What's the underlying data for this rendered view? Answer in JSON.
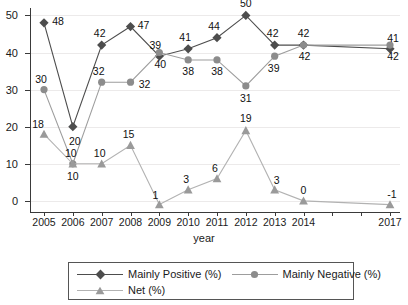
{
  "chart_data": {
    "type": "line",
    "title": "",
    "xlabel": "year",
    "ylabel": "",
    "categories": [
      "2005",
      "2006",
      "2007",
      "2008",
      "2009",
      "2010",
      "2011",
      "2012",
      "2013",
      "2014",
      "2017"
    ],
    "x": [
      2005,
      2006,
      2007,
      2008,
      2009,
      2010,
      2011,
      2012,
      2013,
      2014,
      2017
    ],
    "xlim": [
      2005,
      2017
    ],
    "ylim": [
      -3,
      52
    ],
    "yticks": [
      0,
      10,
      20,
      30,
      40,
      50
    ],
    "ytick_labels": [
      "0",
      "10",
      "20",
      "30",
      "40",
      "50"
    ],
    "grid": true,
    "legend_position": "bottom",
    "series": [
      {
        "name": "Mainly Positive (%)",
        "marker": "diamond",
        "color": "#4d4d4d",
        "values": [
          48,
          20,
          42,
          47,
          39,
          41,
          44,
          50,
          42,
          42,
          41
        ],
        "labels": [
          "48",
          "20",
          "42",
          "47",
          "39",
          "41",
          "44",
          "50",
          "42",
          "42",
          "41"
        ]
      },
      {
        "name": "Mainly Negative (%)",
        "marker": "circle",
        "color": "#8c8c8c",
        "values": [
          30,
          10,
          32,
          32,
          40,
          38,
          38,
          31,
          39,
          42,
          42
        ],
        "labels": [
          "30",
          "10",
          "32",
          "32",
          "40",
          "38",
          "38",
          "31",
          "39",
          "42",
          "42"
        ]
      },
      {
        "name": "Net (%)",
        "marker": "triangle",
        "color": "#9a9a9a",
        "values": [
          18,
          10,
          10,
          15,
          -1,
          3,
          6,
          19,
          3,
          0,
          -1
        ],
        "labels": [
          "18",
          "10",
          "10",
          "15",
          "1",
          "3",
          "6",
          "19",
          "3",
          "0",
          "-1"
        ]
      }
    ]
  },
  "legend": {
    "items": [
      {
        "label": "Mainly Positive (%)"
      },
      {
        "label": "Mainly Negative (%)"
      },
      {
        "label": "Net (%)"
      }
    ]
  },
  "axis": {
    "x_title": "year"
  }
}
